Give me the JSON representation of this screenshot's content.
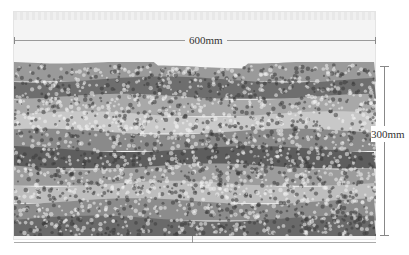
{
  "diagram": {
    "type": "granular-layer-cross-section",
    "width_label": "600mm",
    "height_label": "300mm",
    "layers": [
      {
        "shade": "#9a9a9a"
      },
      {
        "shade": "#6e6e6e"
      },
      {
        "shade": "#a8a8a8"
      },
      {
        "shade": "#c8c8c8"
      },
      {
        "shade": "#8a8a8a"
      },
      {
        "shade": "#5e5e5e"
      },
      {
        "shade": "#9c9c9c"
      },
      {
        "shade": "#bdbdbd"
      },
      {
        "shade": "#8c8c8c"
      },
      {
        "shade": "#6a6a6a"
      }
    ],
    "colors": {
      "background": "#ffffff",
      "container_fill": "#f4f4f4",
      "dimension_line": "#888888",
      "label_text": "#333333"
    }
  }
}
